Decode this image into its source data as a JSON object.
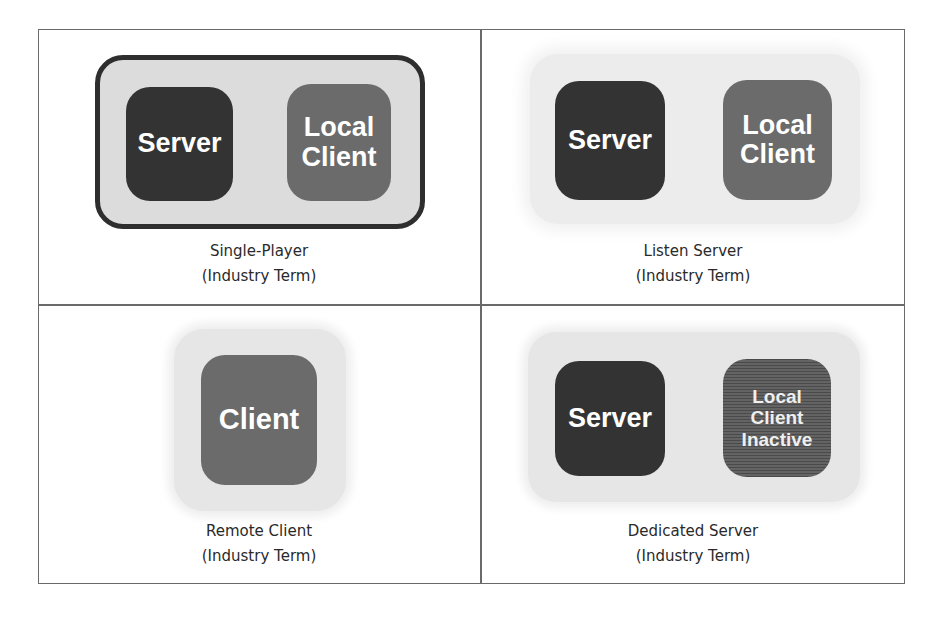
{
  "diagram": {
    "title": "",
    "panels": [
      {
        "id": "single-player",
        "caption_line1": "Single-Player",
        "caption_line2": "(Industry Term)",
        "nodes": [
          {
            "label": "Server",
            "kind": "server"
          },
          {
            "label_line1": "Local",
            "label_line2": "Client",
            "kind": "client"
          }
        ],
        "container": "framed"
      },
      {
        "id": "listen-server",
        "caption_line1": "Listen Server",
        "caption_line2": "(Industry Term)",
        "nodes": [
          {
            "label": "Server",
            "kind": "server"
          },
          {
            "label_line1": "Local",
            "label_line2": "Client",
            "kind": "client"
          }
        ],
        "container": "soft"
      },
      {
        "id": "remote-client",
        "caption_line1": "Remote Client",
        "caption_line2": "(Industry Term)",
        "nodes": [
          {
            "label": "Client",
            "kind": "client"
          }
        ],
        "container": "soft"
      },
      {
        "id": "dedicated-server",
        "caption_line1": "Dedicated Server",
        "caption_line2": "(Industry Term)",
        "nodes": [
          {
            "label": "Server",
            "kind": "server"
          },
          {
            "label_line1": "Local",
            "label_line2": "Client",
            "label_line3": "Inactive",
            "kind": "inactive-client"
          }
        ],
        "container": "soft"
      }
    ],
    "colors": {
      "server": "#333333",
      "client": "#6b6b6b",
      "inactive_client": "#5a5a5a",
      "container_bg": "#dcdcdc",
      "frame_border": "#2e2e2e",
      "grid_line": "#6a6a6a",
      "node_text": "#ffffff",
      "caption_text": "#2a2a2a"
    }
  }
}
